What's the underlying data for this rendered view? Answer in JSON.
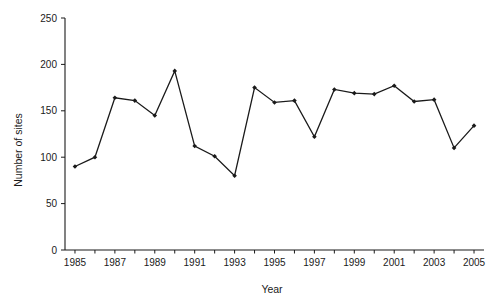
{
  "chart_data": {
    "type": "line",
    "title": "",
    "subtitle": "",
    "xlabel": "Year",
    "ylabel": "Number of sites",
    "x": [
      1985,
      1986,
      1987,
      1988,
      1989,
      1990,
      1991,
      1992,
      1993,
      1994,
      1995,
      1996,
      1997,
      1998,
      1999,
      2000,
      2001,
      2002,
      2003,
      2004,
      2005
    ],
    "values": [
      90,
      100,
      164,
      161,
      145,
      193,
      112,
      101,
      80,
      175,
      159,
      161,
      122,
      173,
      169,
      168,
      177,
      160,
      162,
      110,
      134
    ],
    "series": [
      {
        "name": "Number of sites",
        "values": [
          90,
          100,
          164,
          161,
          145,
          193,
          112,
          101,
          80,
          175,
          159,
          161,
          122,
          173,
          169,
          168,
          177,
          160,
          162,
          110,
          134
        ]
      }
    ],
    "xlim": [
      1984.5,
      2005.5
    ],
    "ylim": [
      0,
      250
    ],
    "ytick_values": [
      0,
      50,
      100,
      150,
      200,
      250
    ],
    "ytick_labels": [
      "0",
      "50",
      "100",
      "150",
      "200",
      "250"
    ],
    "xtick_values": [
      1985,
      1987,
      1989,
      1991,
      1993,
      1995,
      1997,
      1999,
      2001,
      2003,
      2005
    ],
    "xtick_labels": [
      "1985",
      "1987",
      "1989",
      "1991",
      "1993",
      "1995",
      "1997",
      "1999",
      "2001",
      "2003",
      "2005"
    ],
    "x_minor_tick_values": [
      1986,
      1988,
      1990,
      1992,
      1994,
      1996,
      1998,
      2000,
      2002,
      2004
    ],
    "grid": false,
    "legend": false,
    "legend_position": "none",
    "line_color": "#1a1a1a",
    "marker": "diamond",
    "marker_color": "#1a1a1a",
    "background_color": "#ffffff"
  }
}
